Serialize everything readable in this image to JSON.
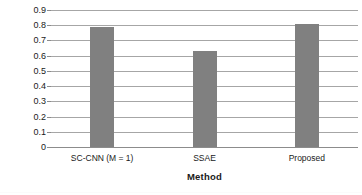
{
  "chart_data": {
    "type": "bar",
    "title": "",
    "xlabel": "Method",
    "ylabel": "F1 Score",
    "categories": [
      "SC-CNN (M = 1)",
      "SSAE",
      "Proposed"
    ],
    "values": [
      0.79,
      0.63,
      0.805
    ],
    "series": [
      {
        "name": "F1 Score",
        "values": [
          0.79,
          0.63,
          0.805
        ]
      }
    ],
    "ylim": [
      0,
      0.9
    ],
    "ytick_labels": [
      "0.9",
      "0.8",
      "0.7",
      "0.6",
      "0.5",
      "0.4",
      "0.3",
      "0.2",
      "0.1",
      "0"
    ],
    "ytick_values": [
      0.9,
      0.8,
      0.7,
      0.6,
      0.5,
      0.4,
      0.3,
      0.2,
      0.1,
      0
    ],
    "ytick_step": 0.1,
    "grid": true,
    "grid_axis": "y",
    "legend": false,
    "legend_position": "none",
    "bar_color": "#808080",
    "gridline_color": "#a6a6a6",
    "axis_color": "#8c8c8c",
    "background_color": "#ffffff",
    "text_color": "#1a1a1a"
  }
}
